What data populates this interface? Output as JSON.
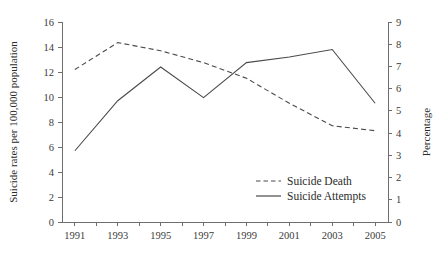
{
  "chart_data": {
    "type": "line",
    "title": "",
    "xlabel": "",
    "ylabel": "Suicide rates per 100,000 population",
    "y2label": "Percentage",
    "x": [
      1991,
      1992,
      1993,
      1994,
      1995,
      1996,
      1997,
      1998,
      1999,
      2000,
      2001,
      2002,
      2003,
      2004,
      2005
    ],
    "xtick_labels": [
      "1991",
      "1993",
      "1995",
      "1997",
      "1999",
      "2001",
      "2003",
      "2005"
    ],
    "xtick_values": [
      1991,
      1993,
      1995,
      1997,
      1999,
      2001,
      2003,
      2005
    ],
    "ytick_labels": [
      "0",
      "2",
      "4",
      "6",
      "8",
      "10",
      "12",
      "14",
      "16"
    ],
    "ytick_values": [
      0,
      2,
      4,
      6,
      8,
      10,
      12,
      14,
      16
    ],
    "y2tick_labels": [
      "0",
      "1",
      "2",
      "3",
      "4",
      "5",
      "6",
      "7",
      "8",
      "9"
    ],
    "y2tick_values": [
      0,
      1,
      2,
      3,
      4,
      5,
      6,
      7,
      8,
      9
    ],
    "ylim": [
      0,
      16
    ],
    "y2lim": [
      0,
      9
    ],
    "xlim": [
      1990.4,
      2005.6
    ],
    "grid": false,
    "legend_position": "center-right-lower",
    "series": [
      {
        "name": "Suicide Death",
        "axis": "left",
        "style": "dashed",
        "color": "#4a4a4a",
        "x": [
          1991,
          1993,
          1995,
          1997,
          1999,
          2001,
          2003,
          2005
        ],
        "values": [
          12.2,
          14.35,
          13.7,
          12.75,
          11.5,
          9.5,
          7.7,
          7.3
        ]
      },
      {
        "name": "Suicide Attempts",
        "axis": "left",
        "style": "solid",
        "color": "#4a4a4a",
        "x": [
          1991,
          1993,
          1995,
          1997,
          1999,
          2001,
          2003,
          2005
        ],
        "values": [
          5.7,
          9.7,
          12.4,
          9.95,
          12.75,
          13.2,
          13.8,
          9.5
        ]
      }
    ],
    "series_right_axis_equivalent": [
      {
        "name": "Suicide Death",
        "values": [
          6.86,
          8.07,
          7.71,
          7.17,
          6.47,
          5.34,
          4.33,
          4.11
        ]
      },
      {
        "name": "Suicide Attempts",
        "values": [
          3.21,
          5.46,
          6.98,
          5.6,
          7.17,
          7.43,
          7.76,
          5.34
        ]
      }
    ]
  },
  "legend": {
    "items": [
      {
        "label": "Suicide Death",
        "style": "dashed"
      },
      {
        "label": "Suicide Attempts",
        "style": "solid"
      }
    ]
  },
  "colors": {
    "line": "#4a4a4a",
    "axis": "#6e6e6e",
    "text": "#2b2b2b",
    "background": "#ffffff"
  }
}
